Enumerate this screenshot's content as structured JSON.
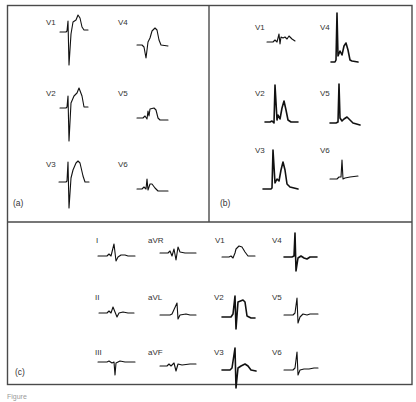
{
  "figure": {
    "caption_fragment": "Figure",
    "colors": {
      "frame": "#4a4a4a",
      "trace": "#111111",
      "label": "#333333"
    },
    "panels": [
      {
        "id": "a",
        "label": "(a)",
        "leads": [
          "V1",
          "V4",
          "V2",
          "V5",
          "V3",
          "V6"
        ]
      },
      {
        "id": "b",
        "label": "(b)",
        "leads": [
          "V1",
          "V4",
          "V2",
          "V5",
          "V3",
          "V6"
        ]
      },
      {
        "id": "c",
        "label": "(c)",
        "leads": [
          "I",
          "aVR",
          "V1",
          "V4",
          "II",
          "aVL",
          "V2",
          "V5",
          "III",
          "aVF",
          "V3",
          "V6"
        ]
      }
    ]
  }
}
